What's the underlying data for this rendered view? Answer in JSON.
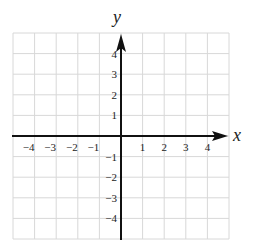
{
  "diagram": {
    "type": "coordinate-plane",
    "axes": {
      "x_label": "x",
      "y_label": "y"
    },
    "x_range": [
      -5,
      5
    ],
    "y_range": [
      -5,
      5
    ],
    "x_ticks": [
      {
        "value": -4,
        "label": "−4"
      },
      {
        "value": -3,
        "label": "−3"
      },
      {
        "value": -2,
        "label": "−2"
      },
      {
        "value": -1,
        "label": "−1"
      },
      {
        "value": 1,
        "label": "1"
      },
      {
        "value": 2,
        "label": "2"
      },
      {
        "value": 3,
        "label": "3"
      },
      {
        "value": 4,
        "label": "4"
      }
    ],
    "y_ticks": [
      {
        "value": 4,
        "label": "4"
      },
      {
        "value": 3,
        "label": "3"
      },
      {
        "value": 2,
        "label": "2"
      },
      {
        "value": 1,
        "label": "1"
      },
      {
        "value": -1,
        "label": "−1"
      },
      {
        "value": -2,
        "label": "−2"
      },
      {
        "value": -3,
        "label": "−3"
      },
      {
        "value": -4,
        "label": "−4"
      }
    ],
    "grid": true,
    "colors": {
      "grid": "#d8d8d8",
      "axis": "#111111",
      "text": "#222222"
    }
  }
}
